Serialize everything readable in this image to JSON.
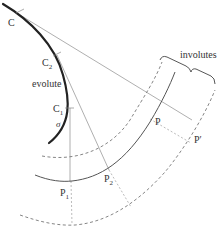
{
  "diagram": {
    "labels": {
      "C": "C",
      "C2_main": "C",
      "C2_sub": "2",
      "C1_main": "C",
      "C1_sub": "1",
      "evolute": "evolute",
      "sigma": "σ",
      "involutes": "involutes",
      "P": "P",
      "P_prime": "P′",
      "P1_main": "P",
      "P1_sub": "1",
      "P2_main": "P",
      "P2_sub": "2"
    },
    "colors": {
      "evolute": "#222222",
      "involute_solid": "#555555",
      "involute_dashed": "#777777",
      "tangent": "#9a9a9a",
      "extension_dashed": "#aaaaaa",
      "text": "#333333"
    }
  }
}
